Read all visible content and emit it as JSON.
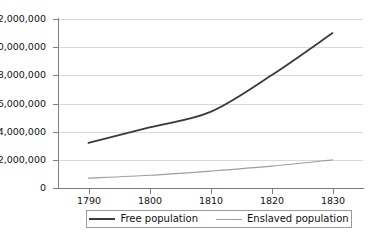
{
  "chart_data": {
    "type": "line",
    "title": "",
    "subtitle": "",
    "xlabel": "",
    "ylabel": "",
    "x": [
      1790,
      1800,
      1810,
      1820,
      1830
    ],
    "categories": [
      "1790",
      "1800",
      "1810",
      "1820",
      "1830"
    ],
    "xlim": [
      1785,
      1835
    ],
    "ylim": [
      0,
      12000000
    ],
    "ytick_labels": [
      "12,000,000",
      "10,000,000",
      "8,000,000",
      "6,000,000",
      "4,000,000",
      "2,000,000",
      "0"
    ],
    "ytick_values": [
      12000000,
      10000000,
      8000000,
      6000000,
      4000000,
      2000000,
      0
    ],
    "xtick_labels": [
      "1790",
      "1800",
      "1810",
      "1820",
      "1830"
    ],
    "grid": true,
    "legend_position": "bottom",
    "series": [
      {
        "name": "Free population",
        "color": "#3a3a3a",
        "values": [
          3200000,
          4300000,
          5400000,
          8000000,
          11000000
        ]
      },
      {
        "name": "Enslaved population",
        "color": "#9e9e9e",
        "values": [
          700000,
          900000,
          1200000,
          1550000,
          2000000
        ]
      }
    ]
  },
  "axes": {
    "y_labels": [
      {
        "text": "12,000,000",
        "value": 12000000
      },
      {
        "text": "10,000,000",
        "value": 10000000
      },
      {
        "text": "8,000,000",
        "value": 8000000
      },
      {
        "text": "6,000,000",
        "value": 6000000
      },
      {
        "text": "4,000,000",
        "value": 4000000
      },
      {
        "text": "2,000,000",
        "value": 2000000
      },
      {
        "text": "0",
        "value": 0
      }
    ],
    "x_labels": [
      {
        "text": "1790",
        "value": 1790
      },
      {
        "text": "1800",
        "value": 1800
      },
      {
        "text": "1810",
        "value": 1810
      },
      {
        "text": "1820",
        "value": 1820
      },
      {
        "text": "1830",
        "value": 1830
      }
    ]
  },
  "legend": {
    "items": [
      {
        "label": "Free population",
        "color": "#3a3a3a"
      },
      {
        "label": "Enslaved population",
        "color": "#9e9e9e"
      }
    ]
  },
  "colors": {
    "free_line": "#3a3a3a",
    "enslaved_line": "#9e9e9e",
    "gridline": "#d9d9d9",
    "axis": "#808080",
    "background": "#ffffff",
    "text": "#111111"
  }
}
